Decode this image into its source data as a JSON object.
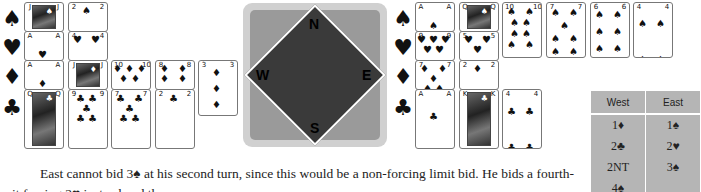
{
  "west_hand": {
    "suit_symbols": [
      "♠",
      "♥",
      "♦",
      "♣"
    ],
    "spades": [
      "J",
      "2"
    ],
    "hearts": [
      "A",
      "4"
    ],
    "diamonds": [
      "A",
      "J",
      "10",
      "8",
      "3"
    ],
    "clubs": [
      "Q",
      "9",
      "7",
      "2"
    ]
  },
  "compass": {
    "north": "N",
    "west": "W",
    "east": "E",
    "south": "S"
  },
  "east_hand": {
    "suit_symbols": [
      "♠",
      "♥",
      "♦",
      "♣"
    ],
    "spades": [
      "A",
      "Q",
      "10",
      "7",
      "6",
      "4"
    ],
    "hearts": [
      "9",
      "5"
    ],
    "diamonds": [
      "7",
      "2"
    ],
    "clubs": [
      "A",
      "K",
      "4"
    ]
  },
  "bidding": {
    "headers": [
      "West",
      "East"
    ],
    "rows": [
      [
        "1♦",
        "1♠"
      ],
      [
        "2♣",
        "2♥"
      ],
      [
        "2NT",
        "3♠"
      ],
      [
        "4♠",
        ""
      ]
    ]
  },
  "text": {
    "paragraph": "East cannot bid 3♠ at his second turn, since this would be a non-forcing limit bid. He bids a fourth-suit forcing 2♥ instead and then"
  }
}
